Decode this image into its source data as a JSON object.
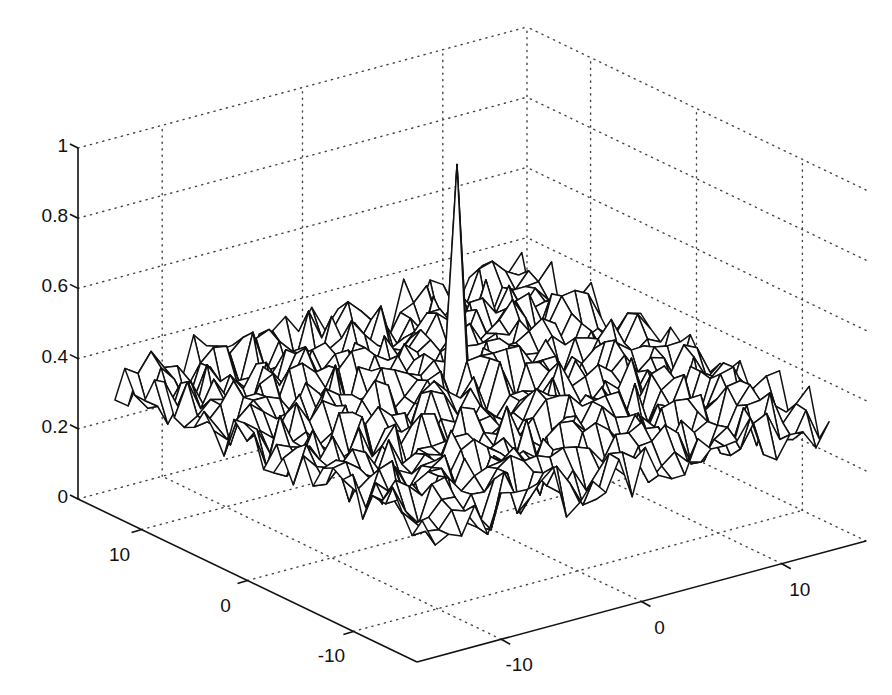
{
  "chart_data": {
    "type": "surface",
    "title": "",
    "xlabel": "",
    "ylabel": "",
    "zlabel": "",
    "x_axis": {
      "range": [
        -16,
        16
      ],
      "ticks": [
        -10,
        0,
        10
      ],
      "tick_labels": [
        "-10",
        "0",
        "10"
      ],
      "position": "front-right edge"
    },
    "y_axis": {
      "range": [
        -16,
        16
      ],
      "ticks": [
        -10,
        0,
        10
      ],
      "tick_labels": [
        "-10",
        "0",
        "10"
      ],
      "position": "front-left edge"
    },
    "z_axis": {
      "range": [
        0,
        1
      ],
      "ticks": [
        0,
        0.2,
        0.4,
        0.6,
        0.8,
        1
      ],
      "tick_labels": [
        "0",
        "0.2",
        "0.4",
        "0.6",
        "0.8",
        "1"
      ]
    },
    "grid": true,
    "grid_style": "dotted",
    "mesh": {
      "grid_size": 32,
      "background_mean": 0.34,
      "background_noise": 0.08,
      "peak": {
        "x": 1,
        "y": 3,
        "z": 0.95
      }
    },
    "colors": {
      "mesh_edge": "#111111",
      "mesh_face": "#ffffff",
      "grid": "#444444",
      "background": "#ffffff"
    }
  }
}
